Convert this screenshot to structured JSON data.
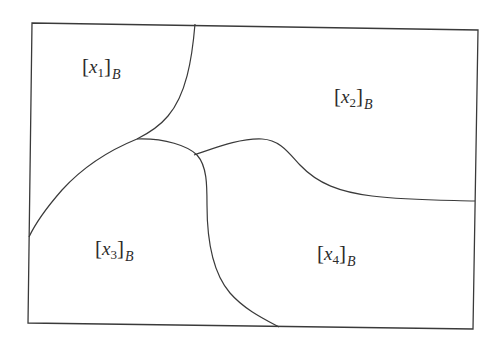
{
  "diagram": {
    "type": "partition-of-region",
    "stroke_color": "#3a3a3a",
    "background": "#ffffff",
    "regions": [
      {
        "id": "region-1",
        "var": "x",
        "index": "1",
        "basis": "B",
        "text": "[x1]B"
      },
      {
        "id": "region-2",
        "var": "x",
        "index": "2",
        "basis": "B",
        "text": "[x2]B"
      },
      {
        "id": "region-3",
        "var": "x",
        "index": "3",
        "basis": "B",
        "text": "[x3]B"
      },
      {
        "id": "region-4",
        "var": "x",
        "index": "4",
        "basis": "B",
        "text": "[x4]B"
      }
    ],
    "brackets": {
      "open": "[",
      "close": "]"
    }
  }
}
